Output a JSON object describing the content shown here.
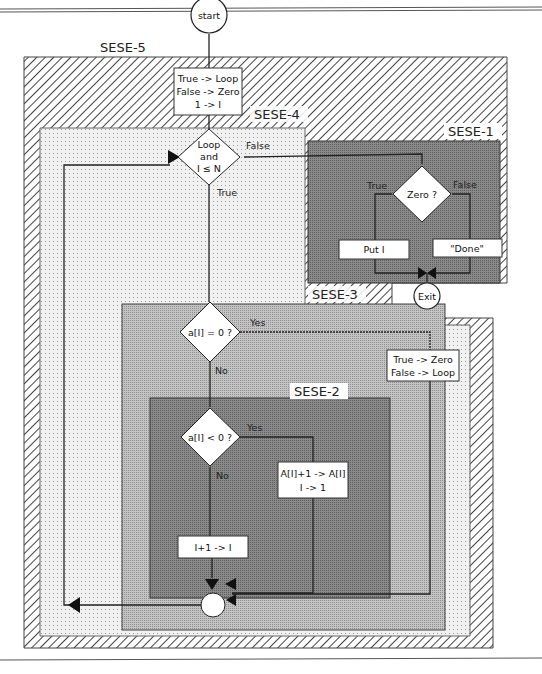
{
  "diagram": {
    "start_node": "start",
    "exit_node": "Exit",
    "regions": [
      {
        "id": "sese5",
        "label": "SESE-5",
        "fill": "diagonal-hatch"
      },
      {
        "id": "sese4",
        "label": "SESE-4",
        "fill": "light-dots"
      },
      {
        "id": "sese1",
        "label": "SESE-1",
        "fill": "#7a7a7a"
      },
      {
        "id": "sese3",
        "label": "SESE-3",
        "fill": "#b4b4b4"
      },
      {
        "id": "sese2",
        "label": "SESE-2",
        "fill": "#7d7d7d"
      }
    ],
    "init_box": {
      "line1": "True -> Loop",
      "line2": "False -> Zero",
      "line3": "1 -> I"
    },
    "loop_decision": {
      "line1": "Loop",
      "line2": "and",
      "line3": "I ≤ N",
      "true_label": "True",
      "false_label": "False"
    },
    "zero_decision": {
      "text": "Zero ?",
      "true_label": "True",
      "false_label": "False"
    },
    "put_box": "Put I",
    "done_box": "\"Done\"",
    "eq_zero_decision": {
      "text": "a[I] = 0 ?",
      "yes_label": "Yes",
      "no_label": "No"
    },
    "set_zero_box": {
      "line1": "True -> Zero",
      "line2": "False -> Loop"
    },
    "lt_zero_decision": {
      "text": "a[I] < 0 ?",
      "yes_label": "Yes",
      "no_label": "No"
    },
    "incr_a_box": {
      "line1": "A[I]+1 -> A[I]",
      "line2": "I -> 1"
    },
    "incr_i_box": "I+1 -> I"
  }
}
